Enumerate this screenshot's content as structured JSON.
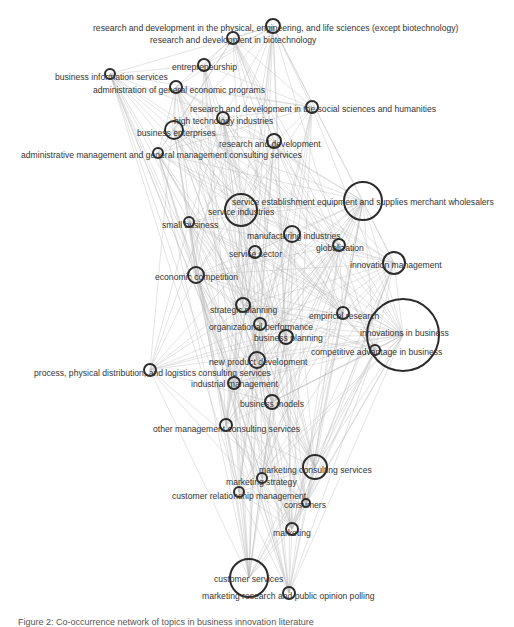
{
  "diagram": {
    "type": "network-graph",
    "colors": {
      "edge": "#b8b8b8",
      "node_stroke": "#2b2b2b",
      "label": "#333333",
      "background": "#ffffff"
    },
    "nodes": [
      {
        "id": "rd_physical",
        "label": "research and development in the physical, engineering, and life sciences (except biotechnology)",
        "cx": 273,
        "cy": 26,
        "r": 7,
        "lx": 93,
        "ly": 31
      },
      {
        "id": "rd_biotech",
        "label": "research and development in biotechnology",
        "cx": 233,
        "cy": 38,
        "r": 6,
        "lx": 150,
        "ly": 43
      },
      {
        "id": "entrepreneurship",
        "label": "entrepreneurship",
        "cx": 204,
        "cy": 65,
        "r": 6,
        "lx": 172,
        "ly": 70
      },
      {
        "id": "business_info",
        "label": "business information services",
        "cx": 110,
        "cy": 74,
        "r": 5,
        "lx": 55,
        "ly": 80
      },
      {
        "id": "admin_econ",
        "label": "administration of general economic programs",
        "cx": 176,
        "cy": 87,
        "r": 6,
        "lx": 93,
        "ly": 93
      },
      {
        "id": "rd_social",
        "label": "research and development in the social sciences and humanities",
        "cx": 312,
        "cy": 107,
        "r": 6,
        "lx": 190,
        "ly": 112
      },
      {
        "id": "high_tech",
        "label": "high technology industries",
        "cx": 223,
        "cy": 118,
        "r": 6,
        "lx": 174,
        "ly": 124
      },
      {
        "id": "business_enterprises",
        "label": "business enterprises",
        "cx": 174,
        "cy": 130,
        "r": 9,
        "lx": 137,
        "ly": 136
      },
      {
        "id": "rd",
        "label": "research and development",
        "cx": 274,
        "cy": 141,
        "r": 7,
        "lx": 219,
        "ly": 147
      },
      {
        "id": "admin_mgmt",
        "label": "administrative management and general management consulting services",
        "cx": 158,
        "cy": 153,
        "r": 5,
        "lx": 21,
        "ly": 158
      },
      {
        "id": "service_establishment",
        "label": "service establishment equipment and supplies merchant wholesalers",
        "cx": 363,
        "cy": 201,
        "r": 19,
        "lx": 232,
        "ly": 205
      },
      {
        "id": "service_industries",
        "label": "service industries",
        "cx": 241,
        "cy": 210,
        "r": 16,
        "lx": 208,
        "ly": 215
      },
      {
        "id": "small_business",
        "label": "small business",
        "cx": 189,
        "cy": 222,
        "r": 5,
        "lx": 162,
        "ly": 228
      },
      {
        "id": "manufacturing",
        "label": "manufacturing industries",
        "cx": 292,
        "cy": 234,
        "r": 8,
        "lx": 247,
        "ly": 239
      },
      {
        "id": "globalization",
        "label": "globalization",
        "cx": 339,
        "cy": 245,
        "r": 6,
        "lx": 316,
        "ly": 251
      },
      {
        "id": "service_sector",
        "label": "service sector",
        "cx": 255,
        "cy": 252,
        "r": 6,
        "lx": 229,
        "ly": 257
      },
      {
        "id": "innovation_mgmt",
        "label": "innovation management",
        "cx": 394,
        "cy": 263,
        "r": 11,
        "lx": 350,
        "ly": 268
      },
      {
        "id": "economic_competition",
        "label": "economic competition",
        "cx": 196,
        "cy": 275,
        "r": 8,
        "lx": 155,
        "ly": 280
      },
      {
        "id": "strategic_planning",
        "label": "strategic planning",
        "cx": 243,
        "cy": 305,
        "r": 7,
        "lx": 210,
        "ly": 313
      },
      {
        "id": "empirical_research",
        "label": "empirical research",
        "cx": 343,
        "cy": 313,
        "r": 6,
        "lx": 309,
        "ly": 319
      },
      {
        "id": "innovations_business",
        "label": "innovations in business",
        "cx": 403,
        "cy": 335,
        "r": 36,
        "lx": 360,
        "ly": 336
      },
      {
        "id": "org_performance",
        "label": "organizational performance",
        "cx": 260,
        "cy": 324,
        "r": 6,
        "lx": 209,
        "ly": 330
      },
      {
        "id": "business_planning",
        "label": "business planning",
        "cx": 286,
        "cy": 337,
        "r": 7,
        "lx": 254,
        "ly": 341
      },
      {
        "id": "competitive_advantage",
        "label": "competitive advantage in business",
        "cx": 375,
        "cy": 350,
        "r": 5,
        "lx": 311,
        "ly": 355
      },
      {
        "id": "new_product",
        "label": "new product development",
        "cx": 257,
        "cy": 360,
        "r": 8,
        "lx": 209,
        "ly": 365
      },
      {
        "id": "process_logistics",
        "label": "process, physical distribution, and logistics consulting services",
        "cx": 150,
        "cy": 370,
        "r": 6,
        "lx": 34,
        "ly": 376
      },
      {
        "id": "industrial_mgmt",
        "label": "industrial management",
        "cx": 234,
        "cy": 383,
        "r": 6,
        "lx": 191,
        "ly": 387
      },
      {
        "id": "business_models",
        "label": "business models",
        "cx": 272,
        "cy": 402,
        "r": 7,
        "lx": 240,
        "ly": 407
      },
      {
        "id": "other_mgmt",
        "label": "other management consulting services",
        "cx": 226,
        "cy": 425,
        "r": 6,
        "lx": 153,
        "ly": 432
      },
      {
        "id": "marketing_consulting",
        "label": "marketing consulting services",
        "cx": 315,
        "cy": 467,
        "r": 12,
        "lx": 259,
        "ly": 473
      },
      {
        "id": "marketing_strategy",
        "label": "marketing strategy",
        "cx": 262,
        "cy": 478,
        "r": 5,
        "lx": 226,
        "ly": 485
      },
      {
        "id": "crm",
        "label": "customer relationship management",
        "cx": 239,
        "cy": 492,
        "r": 5,
        "lx": 172,
        "ly": 499
      },
      {
        "id": "consumers",
        "label": "consumers",
        "cx": 306,
        "cy": 503,
        "r": 4,
        "lx": 284,
        "ly": 508
      },
      {
        "id": "marketing",
        "label": "marketing",
        "cx": 292,
        "cy": 529,
        "r": 6,
        "lx": 273,
        "ly": 536
      },
      {
        "id": "customer_services",
        "label": "customer services",
        "cx": 249,
        "cy": 578,
        "r": 19,
        "lx": 214,
        "ly": 582
      },
      {
        "id": "market_research",
        "label": "marketing research and public opinion polling",
        "cx": 289,
        "cy": 593,
        "r": 6,
        "lx": 202,
        "ly": 599
      }
    ],
    "caption": "Figure 2: Co-occurrence network of topics in business innovation literature"
  }
}
